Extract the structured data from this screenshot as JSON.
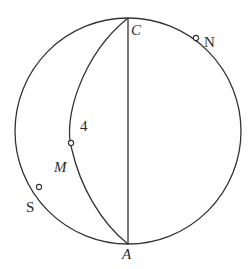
{
  "diagram": {
    "type": "geometry-sphere-arcs",
    "colors": {
      "line": "#333333",
      "background": "#ffffff",
      "text": "#2a2a2a"
    },
    "circle": {
      "cx": 128,
      "cy": 131,
      "r": 113
    },
    "labels": {
      "C": "C",
      "N": "N",
      "four": "4",
      "M": "M",
      "S": "S",
      "A": "A"
    },
    "points": {
      "C": {
        "x": 128,
        "y": 18
      },
      "A": {
        "x": 128,
        "y": 244
      },
      "N": {
        "x": 196,
        "y": 38
      },
      "M": {
        "x": 71,
        "y": 143
      },
      "S": {
        "x": 39,
        "y": 187
      }
    }
  }
}
